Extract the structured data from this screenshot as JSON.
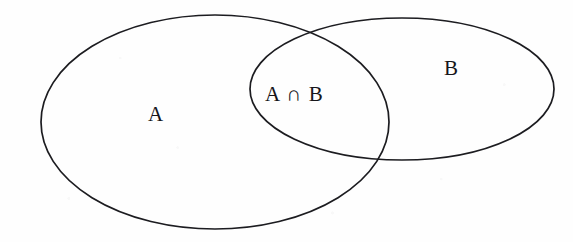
{
  "figure": {
    "kind": "venn-diagram",
    "width": 573,
    "height": 242,
    "background_color": "#fefefe",
    "stroke_color": "#1c1c20"
  },
  "labels": {
    "set_a": "A",
    "set_b": "B",
    "intersection": "A ∩ B"
  },
  "chart_data": {
    "type": "diagram",
    "subtype": "venn",
    "title": "",
    "sets": [
      {
        "name": "A",
        "label": "A",
        "shape": "ellipse",
        "cx": 215,
        "cy": 122,
        "rx": 174,
        "ry": 107,
        "label_x": 157,
        "label_y": 115
      },
      {
        "name": "B",
        "label": "B",
        "shape": "ellipse",
        "cx": 402,
        "cy": 89,
        "rx": 152,
        "ry": 71,
        "label_x": 452,
        "label_y": 69
      }
    ],
    "regions": [
      {
        "id": "A-only",
        "label": "A",
        "x": 157,
        "y": 115
      },
      {
        "id": "A-and-B",
        "label": "A ∩ B",
        "x": 307,
        "y": 95
      },
      {
        "id": "B-only",
        "label": "B",
        "x": 452,
        "y": 69
      }
    ],
    "intersections": [
      {
        "x": 305,
        "y": 30
      },
      {
        "x": 378,
        "y": 163
      }
    ],
    "legend": null,
    "grid": false,
    "xlabel": "",
    "ylabel": ""
  }
}
